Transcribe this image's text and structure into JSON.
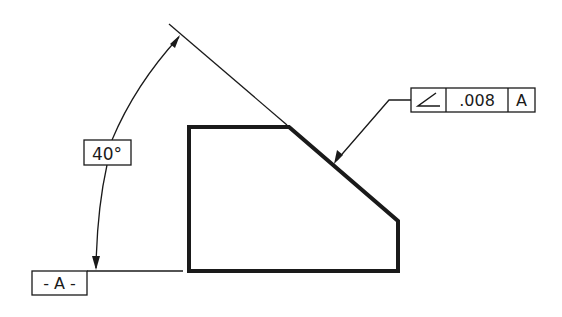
{
  "diagram": {
    "type": "gd-and-t-angularity",
    "colors": {
      "ink": "#1a1a1a",
      "background": "#ffffff"
    },
    "angle_dimension": {
      "value": "40°"
    },
    "datum": {
      "label": "- A -"
    },
    "feature_control_frame": {
      "symbol": "angularity-icon",
      "tolerance": ".008",
      "datum_reference": "A"
    },
    "part_outline": {
      "points": [
        [
          189,
          127
        ],
        [
          289,
          127
        ],
        [
          398,
          221
        ],
        [
          398,
          271
        ],
        [
          189,
          271
        ]
      ]
    }
  }
}
